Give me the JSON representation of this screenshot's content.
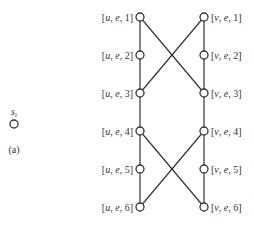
{
  "figure": {
    "panel_label": "(a)",
    "isolated_node": {
      "label": "s",
      "subscript": "i",
      "x": 14,
      "y": 124
    },
    "left_column": {
      "x": 140,
      "nodes": [
        {
          "id": "u1",
          "label": "[u, e, 1]",
          "y": 17
        },
        {
          "id": "u2",
          "label": "[u, e, 2]",
          "y": 55
        },
        {
          "id": "u3",
          "label": "[u, e, 3]",
          "y": 93
        },
        {
          "id": "u4",
          "label": "[u, e, 4]",
          "y": 131
        },
        {
          "id": "u5",
          "label": "[u, e, 5]",
          "y": 169
        },
        {
          "id": "u6",
          "label": "[u, e, 6]",
          "y": 207
        }
      ]
    },
    "right_column": {
      "x": 204,
      "nodes": [
        {
          "id": "v1",
          "label": "[v, e, 1]",
          "y": 17
        },
        {
          "id": "v2",
          "label": "[v, e, 2]",
          "y": 55
        },
        {
          "id": "v3",
          "label": "[v, e, 3]",
          "y": 93
        },
        {
          "id": "v4",
          "label": "[v, e, 4]",
          "y": 131
        },
        {
          "id": "v5",
          "label": "[v, e, 5]",
          "y": 169
        },
        {
          "id": "v6",
          "label": "[v, e, 6]",
          "y": 207
        }
      ]
    },
    "edges": [
      [
        "u1",
        "u2"
      ],
      [
        "u2",
        "u3"
      ],
      [
        "u3",
        "u4"
      ],
      [
        "u4",
        "u5"
      ],
      [
        "u5",
        "u6"
      ],
      [
        "v1",
        "v2"
      ],
      [
        "v2",
        "v3"
      ],
      [
        "v3",
        "v4"
      ],
      [
        "v4",
        "v5"
      ],
      [
        "v5",
        "v6"
      ],
      [
        "u1",
        "v3"
      ],
      [
        "v1",
        "u3"
      ],
      [
        "u4",
        "v6"
      ],
      [
        "v4",
        "u6"
      ]
    ],
    "colors": {
      "line": "#333333",
      "node_fill": "#ffffff"
    }
  }
}
